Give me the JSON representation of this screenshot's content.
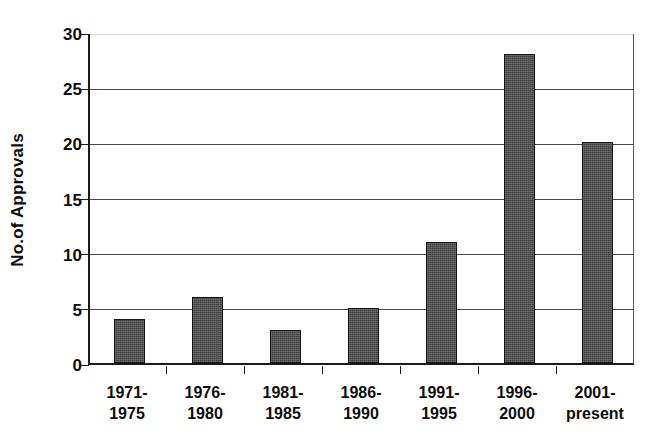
{
  "chart_data": {
    "type": "bar",
    "title": "",
    "xlabel": "",
    "ylabel": "No.of Approvals",
    "categories": [
      "1971-1975",
      "1976-1980",
      "1981-1985",
      "1986-1990",
      "1991-1995",
      "1996-2000",
      "2001-present"
    ],
    "category_lines": [
      {
        "line1": "1971-",
        "line2": "1975"
      },
      {
        "line1": "1976-",
        "line2": "1980"
      },
      {
        "line1": "1981-",
        "line2": "1985"
      },
      {
        "line1": "1986-",
        "line2": "1990"
      },
      {
        "line1": "1991-",
        "line2": "1995"
      },
      {
        "line1": "1996-",
        "line2": "2000"
      },
      {
        "line1": "2001-",
        "line2": "present"
      }
    ],
    "values": [
      4,
      6,
      3,
      5,
      11,
      28,
      20
    ],
    "ylim": [
      0,
      30
    ],
    "ytick_values": [
      0,
      5,
      10,
      15,
      20,
      25,
      30
    ],
    "ytick_labels": [
      "0",
      "5",
      "10",
      "15",
      "20",
      "25",
      "30"
    ],
    "grid": true,
    "grid_axis": "y",
    "legend": false,
    "legend_position": "none",
    "bar_color": "#3b3b3b",
    "bar_edge_color": "#141414",
    "axis_color": "#1a1a1a",
    "grid_color": "#4a4a4a",
    "background_color": "#ffffff"
  }
}
